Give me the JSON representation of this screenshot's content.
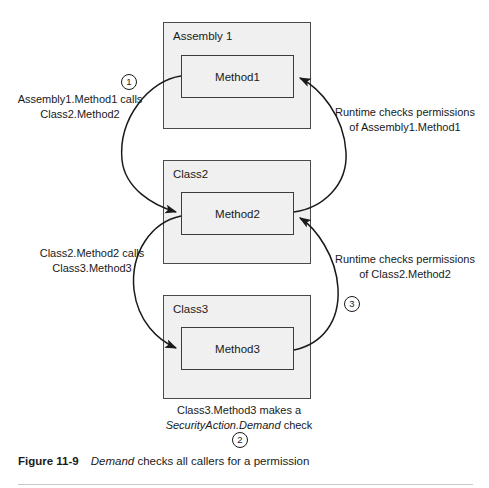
{
  "figure": {
    "label": "Figure 11-9",
    "title_italic": "Demand",
    "title_rest": " checks all callers for a permission"
  },
  "diagram": {
    "containers": [
      {
        "id": "assembly1",
        "label": "Assembly 1",
        "method": "Method1"
      },
      {
        "id": "class2",
        "label": "Class2",
        "method": "Method2"
      },
      {
        "id": "class3",
        "label": "Class3",
        "method": "Method3"
      }
    ],
    "annotations": {
      "call_1_line1": "Assembly1.Method1 calls",
      "call_1_line2": "Class2.Method2",
      "call_2_line1": "Class2.Method2 calls",
      "call_2_line2": "Class3.Method3",
      "check_1_line1": "Runtime checks permissions",
      "check_1_line2": "of Assembly1.Method1",
      "check_2_line1": "Runtime checks permissions",
      "check_2_line2": "of Class2.Method2",
      "demand_line1": "Class3.Method3 makes a",
      "demand_italic": "SecurityAction.Demand",
      "demand_tail": " check"
    },
    "steps": {
      "one": "1",
      "two": "2",
      "three": "3"
    },
    "colors": {
      "box_fill": "#f0f0f0",
      "box_stroke": "#4a4a4a",
      "text": "#1a1a1a",
      "arrow": "#1a1a1a",
      "rule": "#c8c8c8"
    }
  }
}
